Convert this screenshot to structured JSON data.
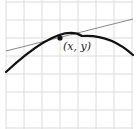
{
  "diagram": {
    "type": "tangent-line-on-concave-curve",
    "point_label": "(x, y)",
    "grid": {
      "x_lines": [
        6,
        24,
        42,
        60,
        78,
        96,
        114,
        132
      ],
      "y_lines": [
        2,
        20,
        38,
        56,
        74,
        92,
        110,
        128
      ],
      "color": "#dcdcdc"
    },
    "curve": {
      "path": "M6,72 Q 60,22 82,36 Q 110,34 133,55",
      "color": "#111111"
    },
    "tangent_line": {
      "x1": 6,
      "y1": 51,
      "x2": 133,
      "y2": 19,
      "color": "#888888"
    },
    "point": {
      "cx": 60,
      "cy": 38,
      "r": 2.6,
      "color": "#111111"
    },
    "label_position": {
      "x": 63,
      "y": 50
    }
  }
}
